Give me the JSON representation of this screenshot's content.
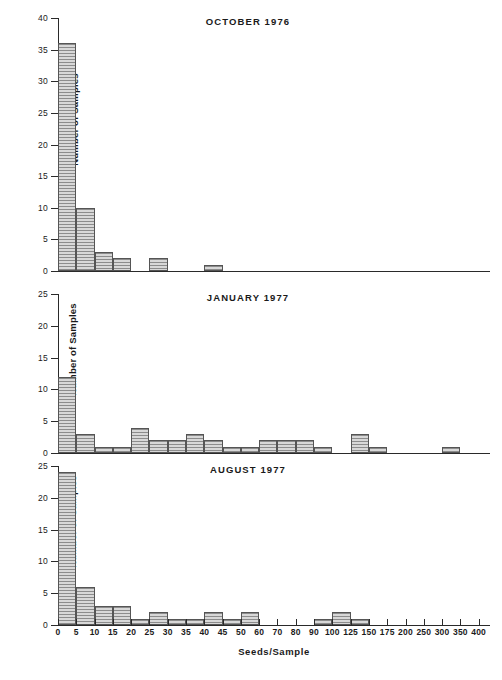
{
  "figure": {
    "xlabel": "Seeds/Sample",
    "ylabel": "Number of Samples",
    "x_tick_labels": [
      "0",
      "5",
      "10",
      "15",
      "20",
      "25",
      "30",
      "35",
      "40",
      "45",
      "50",
      "60",
      "70",
      "80",
      "90",
      "100",
      "125",
      "150",
      "175",
      "200",
      "250",
      "300",
      "350",
      "400"
    ]
  },
  "chart_data": [
    {
      "type": "bar",
      "title": "OCTOBER 1976",
      "xlabel": "Seeds/Sample",
      "ylabel": "Number of Samples",
      "ylim": [
        0,
        40
      ],
      "y_ticks": [
        0,
        5,
        10,
        15,
        20,
        25,
        30,
        35,
        40
      ],
      "y_tick_labels": [
        "0",
        "5",
        "10",
        "15",
        "20",
        "25",
        "30",
        "35",
        "40"
      ],
      "grid": false,
      "legend": "none",
      "bin_edges": [
        "0",
        "5",
        "10",
        "15",
        "20",
        "25",
        "30",
        "35",
        "40",
        "45",
        "50",
        "60",
        "70",
        "80",
        "90",
        "100",
        "125",
        "150",
        "175",
        "200",
        "250",
        "300",
        "350",
        "400"
      ],
      "bins": [
        "0-5",
        "5-10",
        "10-15",
        "15-20",
        "20-25",
        "25-30",
        "30-35",
        "35-40",
        "40-45",
        "45-50",
        "50-60",
        "60-70",
        "70-80",
        "80-90",
        "90-100",
        "100-125",
        "125-150",
        "150-175",
        "175-200",
        "200-250",
        "250-300",
        "300-350",
        "350-400"
      ],
      "values": [
        36,
        10,
        3,
        2,
        0,
        2,
        0,
        0,
        1,
        0,
        0,
        0,
        0,
        0,
        0,
        0,
        0,
        0,
        0,
        0,
        0,
        0,
        0
      ]
    },
    {
      "type": "bar",
      "title": "JANUARY 1977",
      "xlabel": "Seeds/Sample",
      "ylabel": "Number of Samples",
      "ylim": [
        0,
        25
      ],
      "y_ticks": [
        0,
        5,
        10,
        15,
        20,
        25
      ],
      "y_tick_labels": [
        "0",
        "5",
        "10",
        "15",
        "20",
        "25"
      ],
      "grid": false,
      "legend": "none",
      "bin_edges": [
        "0",
        "5",
        "10",
        "15",
        "20",
        "25",
        "30",
        "35",
        "40",
        "45",
        "50",
        "60",
        "70",
        "80",
        "90",
        "100",
        "125",
        "150",
        "175",
        "200",
        "250",
        "300",
        "350",
        "400"
      ],
      "bins": [
        "0-5",
        "5-10",
        "10-15",
        "15-20",
        "20-25",
        "25-30",
        "30-35",
        "35-40",
        "40-45",
        "45-50",
        "50-60",
        "60-70",
        "70-80",
        "80-90",
        "90-100",
        "100-125",
        "125-150",
        "150-175",
        "175-200",
        "200-250",
        "250-300",
        "300-350",
        "350-400"
      ],
      "values": [
        12,
        3,
        1,
        1,
        4,
        2,
        2,
        3,
        2,
        1,
        1,
        2,
        2,
        2,
        1,
        0,
        3,
        1,
        0,
        0,
        0,
        1,
        0
      ]
    },
    {
      "type": "bar",
      "title": "AUGUST 1977",
      "xlabel": "Seeds/Sample",
      "ylabel": "Number of Samples",
      "ylim": [
        0,
        25
      ],
      "y_ticks": [
        0,
        5,
        10,
        15,
        20,
        25
      ],
      "y_tick_labels": [
        "0",
        "5",
        "10",
        "15",
        "20",
        "25"
      ],
      "grid": false,
      "legend": "none",
      "bin_edges": [
        "0",
        "5",
        "10",
        "15",
        "20",
        "25",
        "30",
        "35",
        "40",
        "45",
        "50",
        "60",
        "70",
        "80",
        "90",
        "100",
        "125",
        "150",
        "175",
        "200",
        "250",
        "300",
        "350",
        "400"
      ],
      "bins": [
        "0-5",
        "5-10",
        "10-15",
        "15-20",
        "20-25",
        "25-30",
        "30-35",
        "35-40",
        "40-45",
        "45-50",
        "50-60",
        "60-70",
        "70-80",
        "80-90",
        "90-100",
        "100-125",
        "125-150",
        "150-175",
        "175-200",
        "200-250",
        "250-300",
        "300-350",
        "350-400"
      ],
      "values": [
        24,
        6,
        3,
        3,
        1,
        2,
        1,
        1,
        2,
        1,
        2,
        0,
        0,
        0,
        1,
        2,
        1,
        0,
        0,
        0,
        0,
        0,
        0
      ]
    }
  ]
}
